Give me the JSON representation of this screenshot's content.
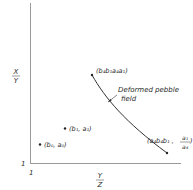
{
  "diagram": {
    "y_axis_label": {
      "numerator": "X",
      "denominator": "Y"
    },
    "x_axis_label": {
      "numerator": "Y",
      "denominator": "Z"
    },
    "origin_labels": {
      "x": "1",
      "y": "1"
    },
    "points": [
      {
        "label": "(b₀, a₀)"
      },
      {
        "label": "(b₁, a₁)"
      }
    ],
    "curve": {
      "name": "Deformed pebble field",
      "line1": "Deformed pebble",
      "line2": "field",
      "top_endpoint_label": "(b₄b₁a₄a₁)",
      "bottom_endpoint_label_main": "(a₄b₄b₁ ,",
      "bottom_endpoint_label_num": "a₁",
      "bottom_endpoint_label_den": "a₄",
      "bottom_endpoint_label_close": ")"
    }
  }
}
